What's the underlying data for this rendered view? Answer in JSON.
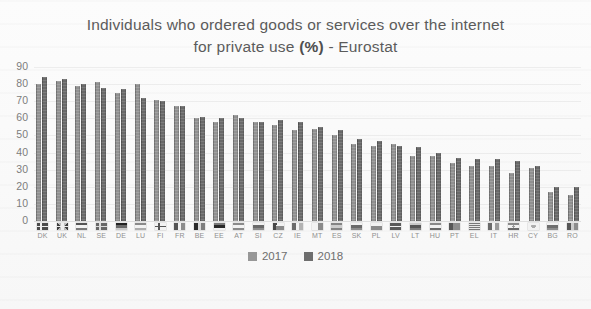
{
  "title": {
    "line1": "Individuals who ordered goods or services over the internet",
    "line2_pre": "for private use ",
    "line2_bold": "(%)",
    "line2_post": " - Eurostat"
  },
  "chart_data": {
    "type": "bar",
    "title": "Individuals who ordered goods or services over the internet for private use (%) - Eurostat",
    "xlabel": "",
    "ylabel": "",
    "ylim": [
      0,
      90
    ],
    "yticks": [
      90,
      80,
      70,
      60,
      50,
      40,
      30,
      20,
      10,
      0
    ],
    "grid": true,
    "legend_position": "bottom",
    "categories": [
      "DK",
      "UK",
      "NL",
      "SE",
      "DE",
      "LU",
      "FI",
      "FR",
      "BE",
      "EE",
      "AT",
      "SI",
      "CZ",
      "IE",
      "MT",
      "ES",
      "SK",
      "PL",
      "LV",
      "LT",
      "HU",
      "PT",
      "EL",
      "IT",
      "HR",
      "CY",
      "BG",
      "RO"
    ],
    "series": [
      {
        "name": "2017",
        "color": "#979797",
        "values": [
          80,
          82,
          79,
          81,
          75,
          80,
          71,
          67,
          60,
          58,
          62,
          58,
          56,
          53,
          54,
          50,
          45,
          44,
          45,
          38,
          38,
          34,
          32,
          32,
          28,
          31,
          17,
          15
        ]
      },
      {
        "name": "2018",
        "color": "#6e6e6e",
        "values": [
          84,
          83,
          80,
          78,
          77,
          72,
          70,
          67,
          61,
          60,
          60,
          58,
          59,
          58,
          55,
          53,
          48,
          47,
          44,
          43,
          40,
          37,
          36,
          36,
          35,
          32,
          20,
          20
        ]
      }
    ]
  },
  "legend": {
    "items": [
      {
        "label": "2017",
        "color": "#979797"
      },
      {
        "label": "2018",
        "color": "#6e6e6e"
      }
    ]
  }
}
